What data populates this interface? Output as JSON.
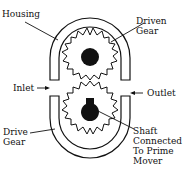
{
  "diagram": {
    "type": "external gear pump cross-section",
    "labels": {
      "housing": "Housing",
      "driven_gear_line1": "Driven",
      "driven_gear_line2": "Gear",
      "inlet": "Inlet",
      "outlet": "Outlet",
      "drive_gear_line1": "Drive",
      "drive_gear_line2": "Gear",
      "shaft_line1": "Shaft",
      "shaft_line2": "Connected",
      "shaft_line3": "To Prime",
      "shaft_line4": "Mover"
    },
    "colors": {
      "ink": "#111111",
      "background": "#ffffff"
    }
  }
}
